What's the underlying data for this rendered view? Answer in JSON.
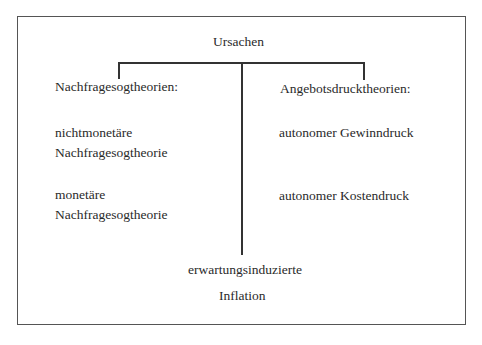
{
  "diagram": {
    "root": "Ursachen",
    "left_branch": {
      "title": "Nachfragesogtheorien:",
      "items": [
        {
          "line1": "nichtmonetäre",
          "line2": "Nachfragesogtheorie"
        },
        {
          "line1": "monetäre",
          "line2": "Nachfragesogtheorie"
        }
      ]
    },
    "right_branch": {
      "title": "Angebotsdrucktheorien:",
      "items": [
        "autonomer Gewinndruck",
        "autonomer Kostendruck"
      ]
    },
    "center_branch": {
      "line1": "erwartungsinduzierte",
      "line2": "Inflation"
    },
    "colors": {
      "border": "#555555",
      "lines": "#333333",
      "text": "#2a2a2a"
    }
  }
}
